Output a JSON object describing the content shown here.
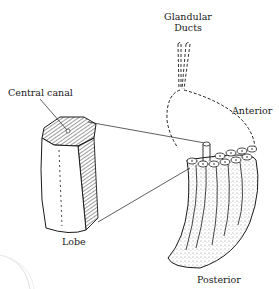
{
  "figure": {
    "type": "anatomical-diagram",
    "labels": {
      "glandular_ducts_line1": "Glandular",
      "glandular_ducts_line2": "Ducts",
      "central_canal": "Central canal",
      "anterior": "Anterior",
      "lobe": "Lobe",
      "posterior": "Posterior"
    },
    "colors": {
      "ink": "#1a1a1a",
      "background": "#ffffff",
      "watermark": "#e4e4e4"
    }
  }
}
